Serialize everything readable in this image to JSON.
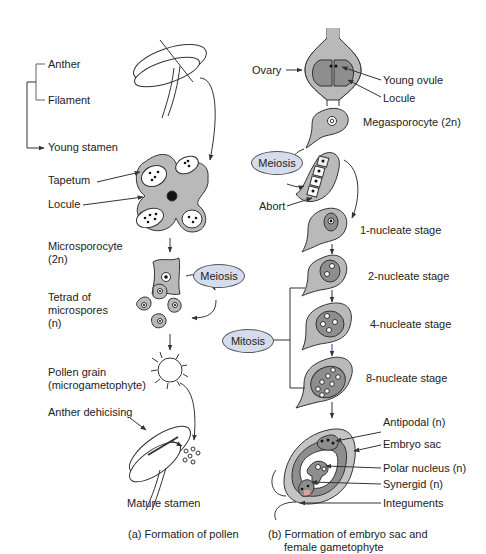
{
  "colors": {
    "tissue_gray": "#b9b9b9",
    "dark_gray": "#8e8e8e",
    "process_oval": "#d5dcec",
    "line": "#333333"
  },
  "panel_a": {
    "caption": "(a) Formation of pollen",
    "labels": {
      "anther": "Anther",
      "filament": "Filament",
      "young_stamen": "Young stamen",
      "tapetum": "Tapetum",
      "locule": "Locule",
      "microsporocyte_line1": "Microsporocyte",
      "microsporocyte_line2": "(2n)",
      "tetrad_line1": "Tetrad of",
      "tetrad_line2": "microspores",
      "tetrad_line3": "(n)",
      "pollen_line1": "Pollen grain",
      "pollen_line2": "(microgametophyte)",
      "anther_dehiscing": "Anther dehicising",
      "mature_stamen": "Mature stamen"
    },
    "process": {
      "meiosis": "Meiosis"
    }
  },
  "panel_b": {
    "caption_line1": "(b) Formation of embryo sac and",
    "caption_line2": "female gametophyte",
    "labels": {
      "ovary": "Ovary",
      "young_ovule": "Young ovule",
      "locule": "Locule",
      "megasporocyte": "Megasporocyte (2n)",
      "abort": "Abort",
      "stage_1": "1-nucleate stage",
      "stage_2": "2-nucleate stage",
      "stage_4": "4-nucleate stage",
      "stage_8": "8-nucleate stage",
      "antipodal": "Antipodal (n)",
      "embryo_sac": "Embryo sac",
      "polar_nucleus": "Polar nucleus (n)",
      "synergid": "Synergid (n)",
      "integuments": "Integuments"
    },
    "process": {
      "meiosis": "Meiosis",
      "mitosis": "Mitosis"
    }
  }
}
